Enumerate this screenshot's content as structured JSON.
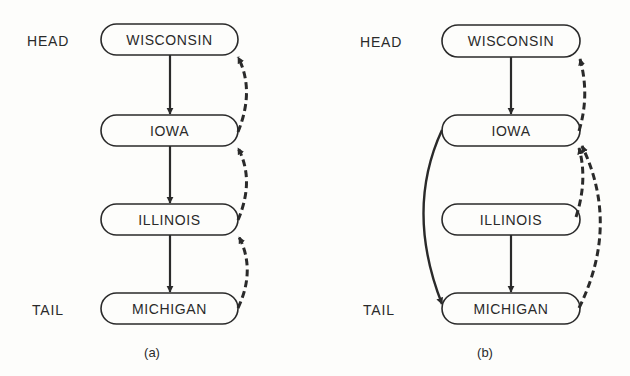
{
  "diagrams": [
    {
      "caption": "(a)",
      "head_label": "HEAD",
      "tail_label": "TAIL",
      "nodes": [
        "WISCONSIN",
        "IOWA",
        "ILLINOIS",
        "MICHIGAN"
      ]
    },
    {
      "caption": "(b)",
      "head_label": "HEAD",
      "tail_label": "TAIL",
      "nodes": [
        "WISCONSIN",
        "IOWA",
        "ILLINOIS",
        "MICHIGAN"
      ]
    }
  ],
  "colors": {
    "ink": "#2a2a2a",
    "background": "#fdfdfb"
  }
}
